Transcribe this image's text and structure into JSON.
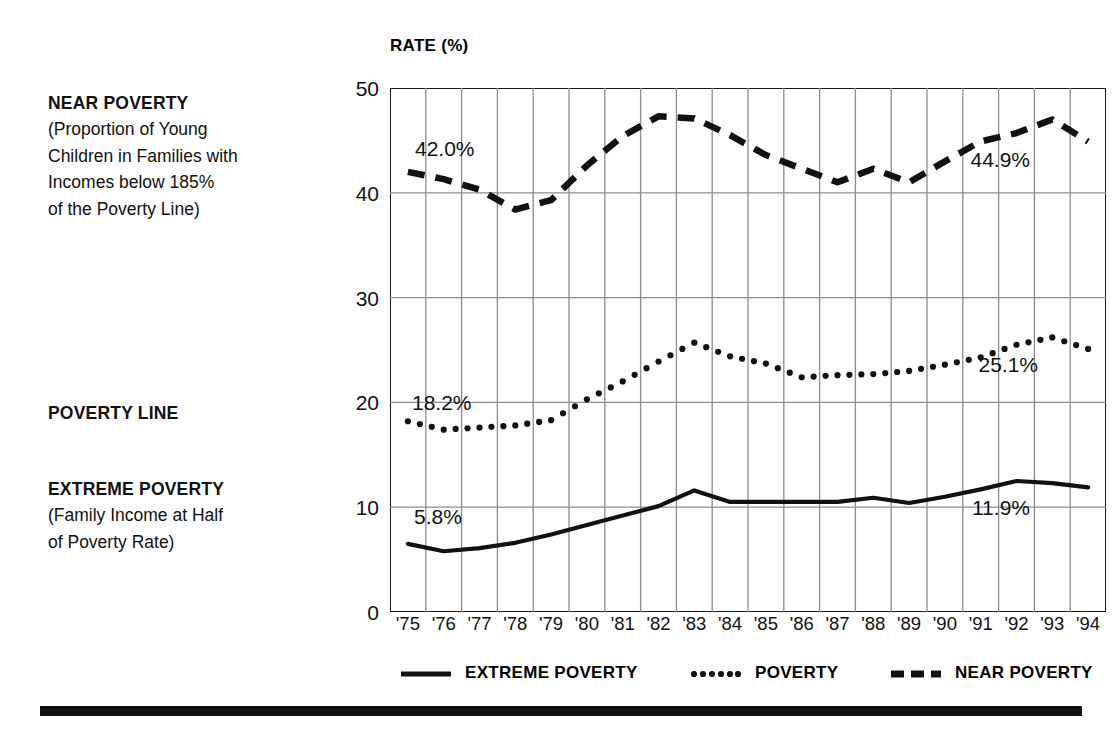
{
  "annotations": {
    "near": {
      "title": "NEAR POVERTY",
      "lines": [
        "(Proportion of Young",
        "Children in Families with",
        "Incomes below 185%",
        "of the Poverty Line)"
      ]
    },
    "poverty": {
      "title": "POVERTY LINE",
      "lines": []
    },
    "extreme": {
      "title": "EXTREME POVERTY",
      "lines": [
        "(Family Income at Half",
        "of Poverty Rate)"
      ]
    }
  },
  "legend": [
    {
      "label": "EXTREME POVERTY",
      "style": "solid"
    },
    {
      "label": "POVERTY",
      "style": "dotted"
    },
    {
      "label": "NEAR POVERTY",
      "style": "dashed"
    }
  ],
  "point_labels": {
    "extreme_start": "5.8%",
    "extreme_end": "11.9%",
    "poverty_start": "18.2%",
    "poverty_end": "25.1%",
    "near_start": "42.0%",
    "near_end": "44.9%"
  },
  "colors": {
    "ink": "#111111",
    "grid": "#8c8c8c",
    "frame": "#1a1a1a",
    "background": "#ffffff"
  },
  "chart_data": {
    "type": "line",
    "title": "",
    "xlabel": "",
    "ylabel": "RATE (%)",
    "ylim": [
      0,
      50
    ],
    "yticks": [
      0,
      10,
      20,
      30,
      40,
      50
    ],
    "grid": true,
    "legend_position": "bottom",
    "x": [
      "'75",
      "'76",
      "'77",
      "'78",
      "'79",
      "'80",
      "'81",
      "'82",
      "'83",
      "'84",
      "'85",
      "'86",
      "'87",
      "'88",
      "'89",
      "'90",
      "'91",
      "'92",
      "'93",
      "'94"
    ],
    "categories": [
      "'75",
      "'76",
      "'77",
      "'78",
      "'79",
      "'80",
      "'81",
      "'82",
      "'83",
      "'84",
      "'85",
      "'86",
      "'87",
      "'88",
      "'89",
      "'90",
      "'91",
      "'92",
      "'93",
      "'94"
    ],
    "series": [
      {
        "name": "EXTREME POVERTY",
        "style": "solid",
        "values": [
          6.5,
          5.8,
          6.1,
          6.6,
          7.4,
          8.3,
          9.2,
          10.1,
          11.6,
          10.5,
          10.5,
          10.5,
          10.5,
          10.9,
          10.4,
          11.0,
          11.7,
          12.5,
          12.3,
          11.9
        ]
      },
      {
        "name": "POVERTY",
        "style": "dotted",
        "values": [
          18.2,
          17.4,
          17.6,
          17.8,
          18.3,
          20.3,
          22.0,
          23.9,
          25.7,
          24.4,
          23.7,
          22.4,
          22.6,
          22.7,
          23.0,
          23.6,
          24.3,
          25.5,
          26.2,
          25.1
        ]
      },
      {
        "name": "NEAR POVERTY",
        "style": "dashed",
        "values": [
          42.0,
          41.3,
          40.3,
          38.4,
          39.3,
          42.6,
          45.4,
          47.3,
          47.1,
          45.5,
          43.6,
          42.3,
          41.0,
          42.3,
          41.0,
          43.0,
          44.9,
          45.7,
          47.0,
          44.9
        ]
      }
    ]
  }
}
